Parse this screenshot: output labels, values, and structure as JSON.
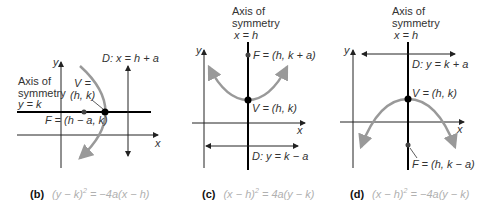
{
  "colors": {
    "curve": "#999999",
    "axis": "#222222",
    "symmetry_axis": "#000000",
    "equation_text": "#b0b0b0",
    "label_text": "#333333"
  },
  "panels": [
    {
      "id": "b",
      "caption_letter": "(b)",
      "equation": "(y − k)² = −4a(x − h)",
      "equation_lhs": "(y − k)",
      "equation_exp": "2",
      "equation_rhs": " = −4a(x − h)",
      "axis_x_label": "x",
      "axis_y_label": "y",
      "symmetry_label_line1": "Axis of",
      "symmetry_label_line2": "symmetry",
      "symmetry_label_line3": "y = k",
      "vertex_label_line1": "V =",
      "vertex_label_line2": "(h, k)",
      "focus_label": "F = (h − a, k)",
      "directrix_label": "D: x = h + a"
    },
    {
      "id": "c",
      "caption_letter": "(c)",
      "equation": "(x − h)² = 4a(y − k)",
      "equation_lhs": "(x − h)",
      "equation_exp": "2",
      "equation_rhs": " = 4a(y − k)",
      "axis_x_label": "x",
      "axis_y_label": "y",
      "symmetry_label_line1": "Axis of",
      "symmetry_label_line2": "symmetry",
      "symmetry_label_line3": "x = h",
      "vertex_label": "V = (h, k)",
      "focus_label": "F = (h, k + a)",
      "directrix_label": "D: y = k − a"
    },
    {
      "id": "d",
      "caption_letter": "(d)",
      "equation": "(x − h)² = −4a(y − k)",
      "equation_lhs": "(x − h)",
      "equation_exp": "2",
      "equation_rhs": " = −4a(y − k)",
      "axis_x_label": "x",
      "axis_y_label": "y",
      "symmetry_label_line1": "Axis of",
      "symmetry_label_line2": "symmetry",
      "symmetry_label_line3": "x = h",
      "vertex_label": "V = (h, k)",
      "focus_label": "F = (h, k − a)",
      "directrix_label": "D: y = k + a"
    }
  ]
}
